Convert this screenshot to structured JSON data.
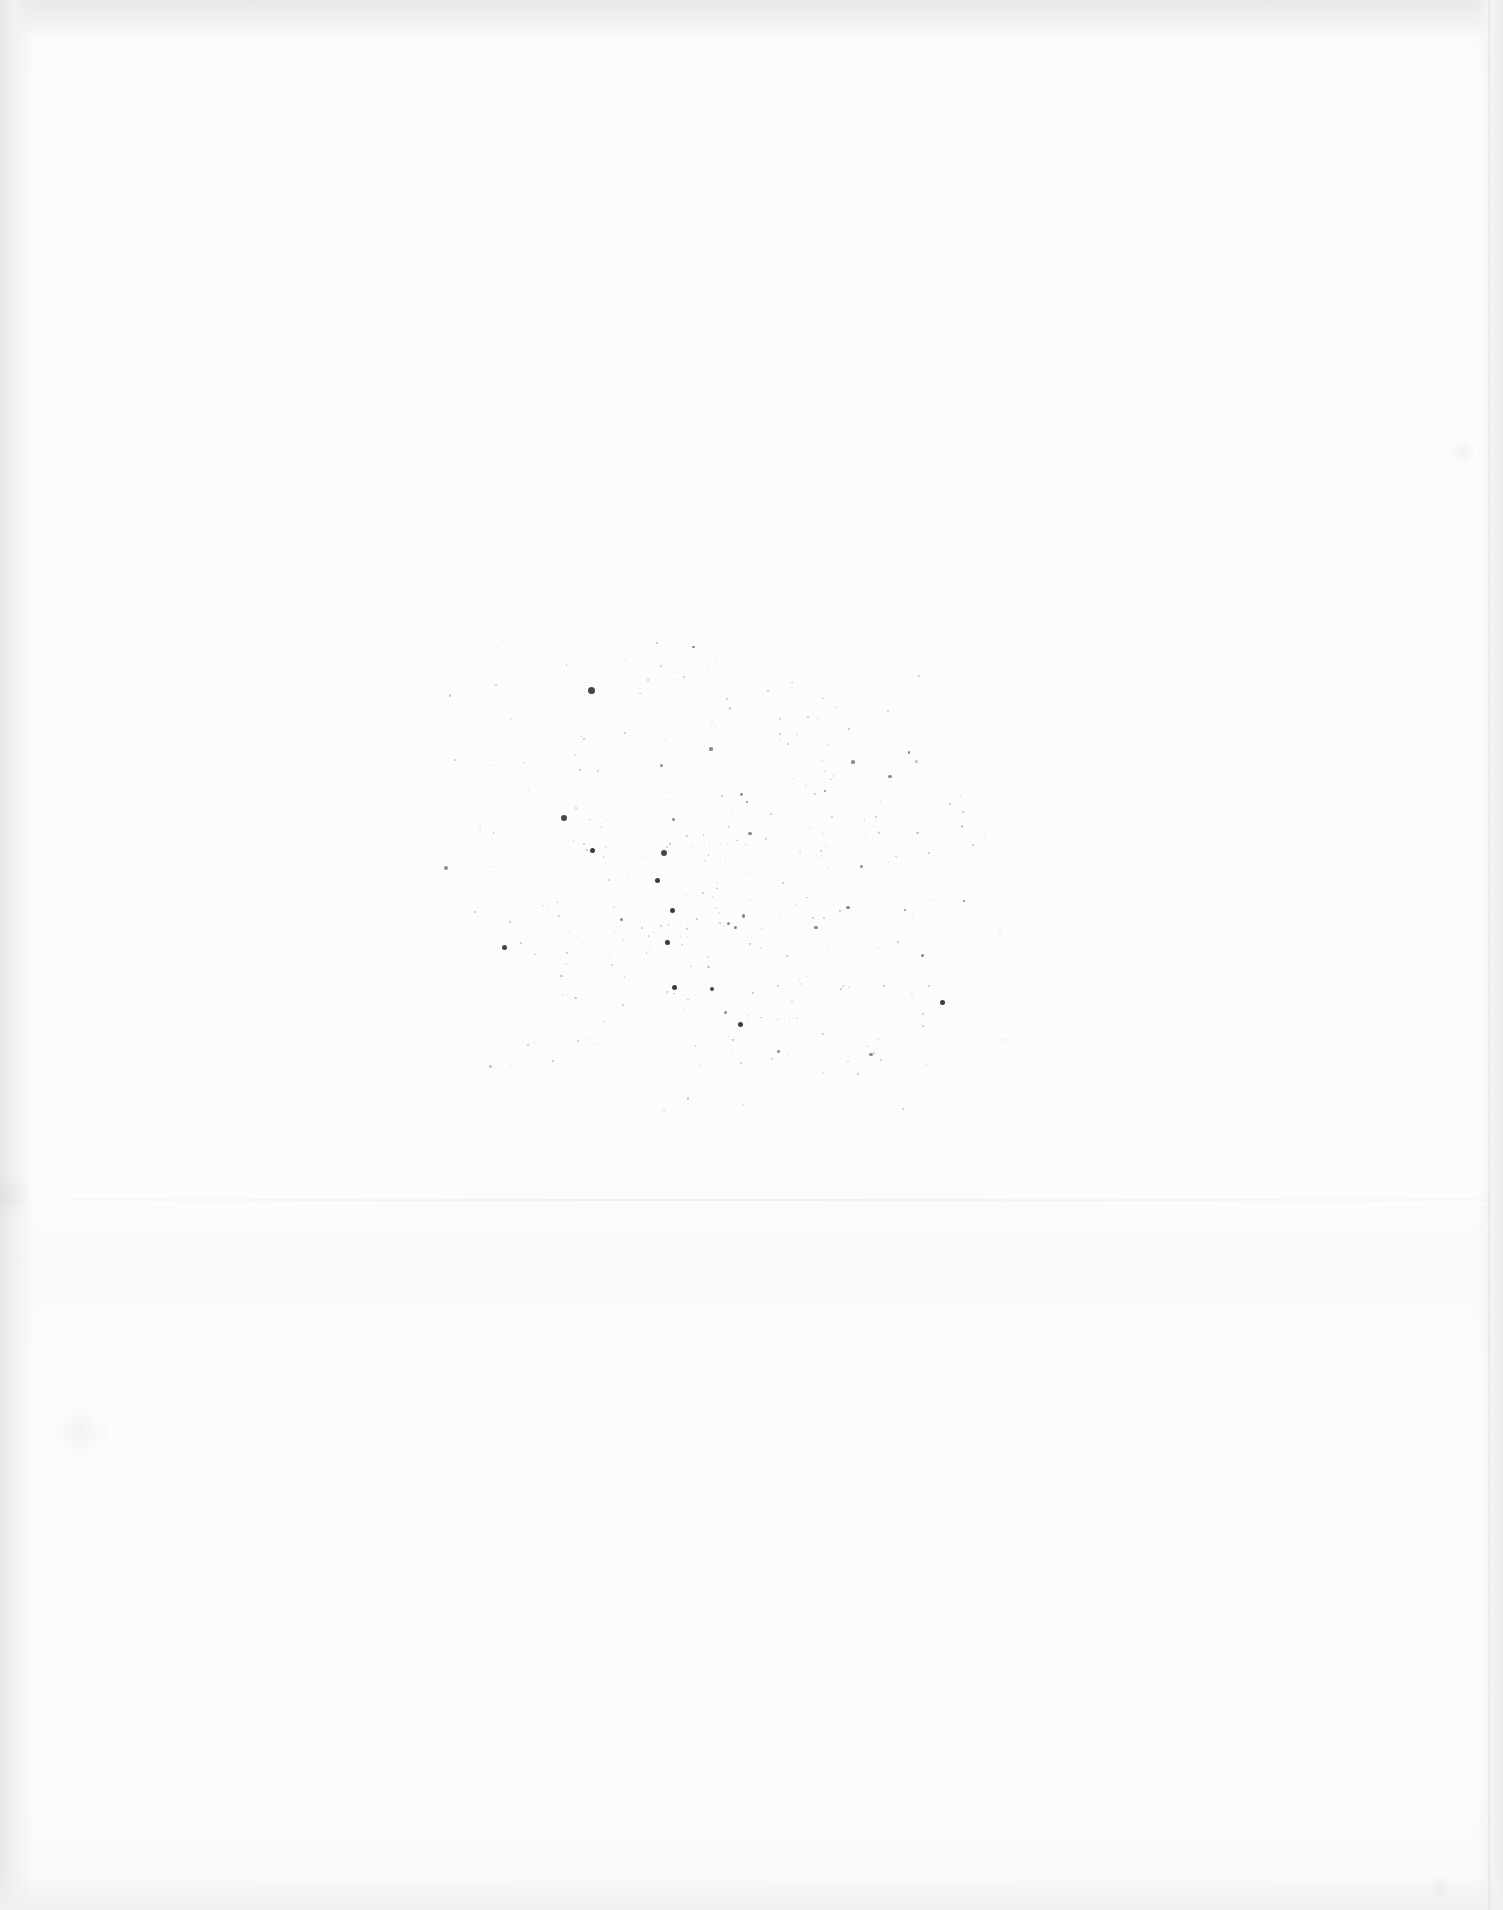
{
  "document": {
    "kind": "scanned-page",
    "content_state": "blank",
    "page_width_px": 1503,
    "page_height_px": 1910,
    "visible_text": [],
    "description": "Blank verso / separator page of a scanned document. No printed text, headings, figures, captions, page numbers or marginalia are legible anywhere on the page."
  },
  "colors": {
    "paper": "#fdfdfd",
    "paper_shadow": "#fafafa",
    "edge_vignette": "#ececec",
    "edge_vignette_dark": "#e8e8e8",
    "speck": "#2b2b2b",
    "seam": "#f4f4f4"
  },
  "artifacts": {
    "edges": [
      {
        "name": "top-edge-vignette",
        "position": "top",
        "thickness_px": 40,
        "tone": "#e9e9e9"
      },
      {
        "name": "left-edge-vignette",
        "position": "left",
        "thickness_px": 34,
        "tone": "#e8e8e8"
      },
      {
        "name": "right-edge-vignette",
        "position": "right",
        "thickness_px": 26,
        "tone": "#ededed"
      },
      {
        "name": "bottom-edge-vignette",
        "position": "bottom",
        "thickness_px": 36,
        "tone": "#f0f0f0"
      }
    ],
    "seams": [
      {
        "name": "vertical-scan-seam",
        "orientation": "vertical",
        "at_px": 1488
      },
      {
        "name": "horizontal-tone-seam",
        "orientation": "horizontal",
        "at_px": 1199
      }
    ],
    "speck_cluster": {
      "name": "show-through-speckle",
      "note": "Diffuse cluster of dust / ink show-through from the reverse side. Not legible as characters.",
      "bounds_px": {
        "x": 420,
        "y": 640,
        "w": 600,
        "h": 480
      },
      "dense_core_px": {
        "x": 580,
        "y": 750,
        "w": 300,
        "h": 290
      }
    },
    "smudges": [
      {
        "name": "left-margin-smudge",
        "x": 8,
        "y": 1196,
        "r": 26
      },
      {
        "name": "lower-left-faint-mark",
        "x": 80,
        "y": 1432,
        "r": 30
      },
      {
        "name": "right-margin-faint-mark",
        "x": 1463,
        "y": 452,
        "r": 14
      },
      {
        "name": "lower-right-faint-mark",
        "x": 1440,
        "y": 1888,
        "r": 12
      }
    ]
  }
}
